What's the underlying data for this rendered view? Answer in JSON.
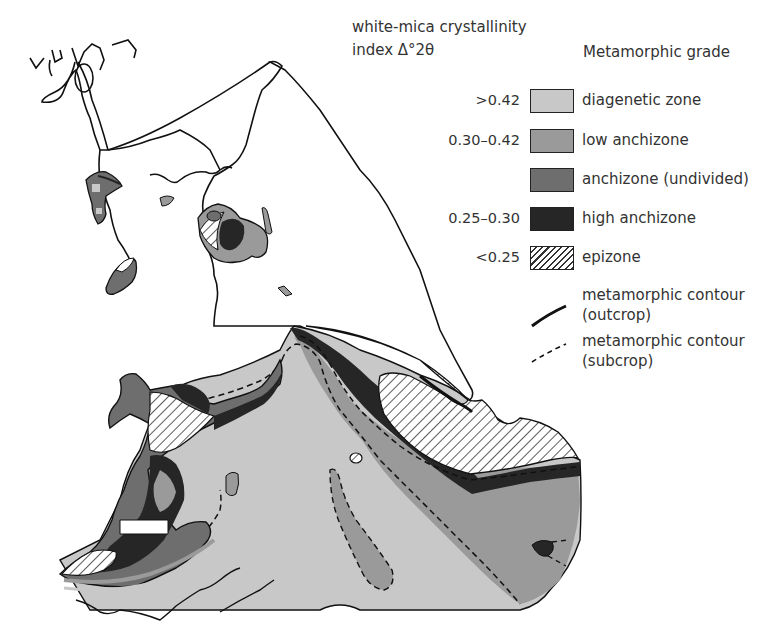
{
  "legend": {
    "index_title_line1": "white-mica crystallinity",
    "index_title_line2": "index Δ°2θ",
    "grade_title": "Metamorphic grade",
    "items": [
      {
        "value": ">0.42",
        "label": "diagenetic zone",
        "color": "#c8c8c8",
        "pattern": "solid"
      },
      {
        "value": "0.30–0.42",
        "label": "low anchizone",
        "color": "#9a9a9a",
        "pattern": "solid"
      },
      {
        "value": "",
        "label": "anchizone (undivided)",
        "color": "#6e6e6e",
        "pattern": "solid"
      },
      {
        "value": "0.25–0.30",
        "label": "high anchizone",
        "color": "#262626",
        "pattern": "solid"
      },
      {
        "value": "<0.25",
        "label": "epizone",
        "color": "#ffffff",
        "pattern": "hatched"
      }
    ],
    "contours": [
      {
        "style": "solid",
        "label_line1": "metamorphic contour",
        "label_line2": "(outcrop)"
      },
      {
        "style": "dashed",
        "label_line1": "metamorphic contour",
        "label_line2": "(subcrop)"
      }
    ]
  },
  "colors": {
    "diagenetic": "#c8c8c8",
    "low_anchizone": "#9a9a9a",
    "anchizone": "#6e6e6e",
    "high_anchizone": "#262626",
    "outline": "#111111"
  }
}
